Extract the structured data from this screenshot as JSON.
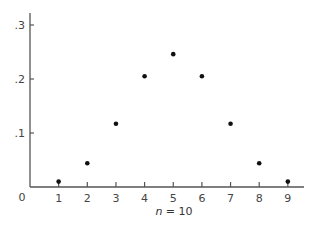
{
  "chart_data": {
    "type": "scatter",
    "title": "",
    "xlabel": "n = 10",
    "xlabel_var": "n",
    "xlabel_rest": " = 10",
    "ylabel": "",
    "origin_label": "0",
    "x": [
      1,
      2,
      3,
      4,
      5,
      6,
      7,
      8,
      9
    ],
    "values": [
      0.01,
      0.044,
      0.117,
      0.205,
      0.246,
      0.205,
      0.117,
      0.044,
      0.01
    ],
    "x_ticks": [
      "1",
      "2",
      "3",
      "4",
      "5",
      "6",
      "7",
      "8",
      "9"
    ],
    "y_ticks": [
      ".1",
      ".2",
      ".3"
    ],
    "y_tick_values": [
      0.1,
      0.2,
      0.3
    ],
    "xlim": [
      0,
      9.5
    ],
    "ylim": [
      0,
      0.32
    ],
    "grid": false,
    "legend": "none",
    "point_color": "#111111",
    "axis_color": "#555555"
  }
}
